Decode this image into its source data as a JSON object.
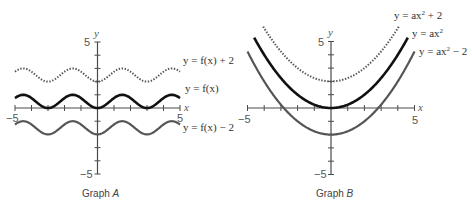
{
  "chart_data": [
    {
      "type": "line",
      "title": "Graph A",
      "caption_prefix": "Graph ",
      "caption_letter": "A",
      "xlabel": "x",
      "ylabel": "y",
      "xlim": [
        -5,
        5
      ],
      "ylim": [
        -5,
        5
      ],
      "x_tick_labels": [
        "-5",
        "5"
      ],
      "y_tick_labels": [
        "5",
        "-5"
      ],
      "ticks_every": 1,
      "grid": false,
      "legend": "inline labels at right",
      "series": [
        {
          "name": "y = f(x) + 2",
          "style": "dotted",
          "function": "f(x)+2",
          "x": [
            -5,
            -4.5,
            -4,
            -3.5,
            -3,
            -2.5,
            -2,
            -1.5,
            -1,
            -0.5,
            0,
            0.5,
            1,
            1.5,
            2,
            2.5,
            3,
            3.5,
            4,
            4.5,
            5
          ],
          "values": [
            2.75,
            2.25,
            2.25,
            2.75,
            2,
            2.25,
            2.75,
            3,
            2.75,
            2.25,
            2,
            2.25,
            2.75,
            3,
            2.75,
            2.25,
            2,
            2.25,
            2.75,
            3,
            2.75
          ]
        },
        {
          "name": "y = f(x)",
          "style": "solid-bold",
          "function": "f(x)",
          "x": [
            -5,
            -4.5,
            -4,
            -3.5,
            -3,
            -2.5,
            -2,
            -1.5,
            -1,
            -0.5,
            0,
            0.5,
            1,
            1.5,
            2,
            2.5,
            3,
            3.5,
            4,
            4.5,
            5
          ],
          "values": [
            0.75,
            1,
            0.75,
            0.25,
            0,
            0.25,
            0.75,
            1,
            0.75,
            0.25,
            0,
            0.25,
            0.75,
            1,
            0.75,
            0.25,
            0,
            0.25,
            0.75,
            1,
            0.75
          ]
        },
        {
          "name": "y = f(x) − 2",
          "style": "solid-gray",
          "function": "f(x)-2",
          "x": [
            -5,
            -4.5,
            -4,
            -3.5,
            -3,
            -2.5,
            -2,
            -1.5,
            -1,
            -0.5,
            0,
            0.5,
            1,
            1.5,
            2,
            2.5,
            3,
            3.5,
            4,
            4.5,
            5
          ],
          "values": [
            -1.25,
            -1,
            -1.25,
            -1.75,
            -2,
            -1.75,
            -1.25,
            -1,
            -1.25,
            -1.75,
            -2,
            -1.75,
            -1.25,
            -1,
            -1.25,
            -1.75,
            -2,
            -1.75,
            -1.25,
            -1,
            -1.25
          ]
        }
      ],
      "period": 3,
      "amplitude_range": [
        0,
        1
      ]
    },
    {
      "type": "line",
      "title": "Graph B",
      "caption_prefix": "Graph ",
      "caption_letter": "B",
      "xlabel": "x",
      "ylabel": "y",
      "xlim": [
        -5,
        5
      ],
      "ylim": [
        -5,
        5
      ],
      "x_tick_labels": [
        "-5",
        "5"
      ],
      "y_tick_labels": [
        "5",
        "-5"
      ],
      "ticks_every": 1,
      "grid": false,
      "legend": "inline labels at upper right",
      "a": 0.25,
      "series": [
        {
          "name": "y = ax² + 2",
          "label_base": "y = ax",
          "label_sup": "2",
          "label_tail": " + 2",
          "style": "dotted",
          "shift": 2,
          "x": [
            -4,
            -3,
            -2,
            -1,
            0,
            1,
            2,
            3,
            4
          ],
          "values": [
            6,
            4.25,
            3,
            2.25,
            2,
            2.25,
            3,
            4.25,
            6
          ]
        },
        {
          "name": "y = ax²",
          "label_base": "y = ax",
          "label_sup": "2",
          "label_tail": "",
          "style": "solid-bold",
          "shift": 0,
          "x": [
            -4.6,
            -4,
            -3,
            -2,
            -1,
            0,
            1,
            2,
            3,
            4,
            4.6
          ],
          "values": [
            5.29,
            4,
            2.25,
            1,
            0.25,
            0,
            0.25,
            1,
            2.25,
            4,
            5.29
          ]
        },
        {
          "name": "y = ax² − 2",
          "label_base": "y = ax",
          "label_sup": "2",
          "label_tail": " − 2",
          "style": "solid-gray",
          "shift": -2,
          "x": [
            -5,
            -4,
            -3,
            -2,
            -1,
            0,
            1,
            2,
            3,
            4,
            5
          ],
          "values": [
            4.25,
            2,
            0.25,
            -1,
            -1.75,
            -2,
            -1.75,
            -1,
            0.25,
            2,
            4.25
          ]
        }
      ]
    }
  ],
  "graphs": {
    "a": {
      "caption_prefix": "Graph ",
      "caption_letter": "A",
      "x_axis_name": "x",
      "y_axis_name": "y",
      "x_min_label": "−5",
      "x_max_label": "5",
      "y_max_label": "5",
      "y_min_label": "−5",
      "labels": {
        "up": "y = f(x) + 2",
        "base": "y = f(x)",
        "down": "y = f(x) − 2"
      }
    },
    "b": {
      "caption_prefix": "Graph ",
      "caption_letter": "B",
      "x_axis_name": "x",
      "y_axis_name": "y",
      "x_min_label": "−5",
      "x_max_label": "5",
      "y_max_label": "5",
      "y_min_label": "−5",
      "labels": {
        "up_base": "y = ax",
        "up_sup": "2",
        "up_tail": " + 2",
        "base_base": "y = ax",
        "base_sup": "2",
        "base_tail": "",
        "down_base": "y = ax",
        "down_sup": "2",
        "down_tail": " − 2"
      }
    }
  },
  "colors": {
    "axis": "#4a4a4a",
    "base_curve": "#111111",
    "shifted_curve": "#555555"
  }
}
